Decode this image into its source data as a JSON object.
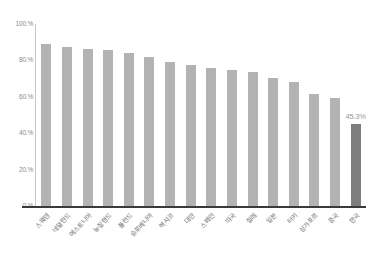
{
  "chart_data": {
    "type": "bar",
    "title": "",
    "subtitle": "",
    "xlabel": "",
    "ylabel": "",
    "ylim": [
      0,
      100
    ],
    "yticks": [
      0,
      20,
      40,
      60,
      80,
      100
    ],
    "ytick_labels": [
      "0.%",
      "20.%",
      "40.%",
      "60.%",
      "80.%",
      "100.%"
    ],
    "grid": false,
    "legend": null,
    "categories": [
      "스웨덴",
      "네덜란드",
      "에스토니아",
      "뉴질랜드",
      "폴란드",
      "슬로베니아",
      "멕시코",
      "대만",
      "스페인",
      "미국",
      "칠레",
      "일본",
      "터키",
      "싱가포르",
      "중국",
      "한국"
    ],
    "values": [
      89.0,
      87.5,
      86.5,
      85.5,
      84.0,
      82.0,
      79.0,
      77.5,
      76.0,
      74.5,
      73.5,
      70.5,
      68.0,
      61.5,
      59.5,
      45.3
    ],
    "bar_color": "#b3b3b3",
    "highlight_color": "#7e7e7e",
    "highlight_index": 15,
    "data_labels": [
      {
        "index": 15,
        "text": "45.3%"
      }
    ]
  }
}
